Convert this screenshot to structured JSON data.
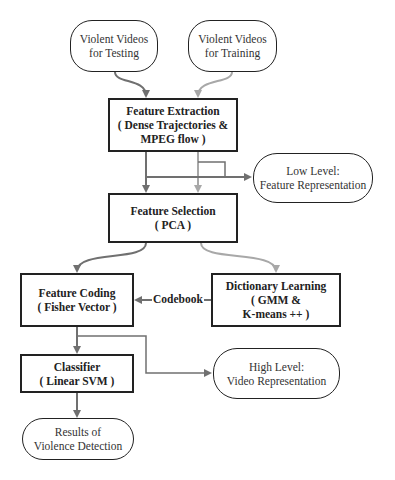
{
  "nodes": {
    "testing": {
      "line1": "Violent Videos",
      "line2": "for Testing"
    },
    "training": {
      "line1": "Violent Videos",
      "line2": "for Training"
    },
    "extraction": {
      "line1": "Feature Extraction",
      "line2": "( Dense Trajectories &",
      "line3": "MPEG flow )"
    },
    "low_level": {
      "line1": "Low Level:",
      "line2": "Feature Representation"
    },
    "selection": {
      "line1": "Feature Selection",
      "line2": "( PCA )"
    },
    "coding": {
      "line1": "Feature Coding",
      "line2": "( Fisher Vector )"
    },
    "dictionary": {
      "line1": "Dictionary Learning",
      "line2": "( GMM &",
      "line3": "K-means ++ )"
    },
    "classifier": {
      "line1": "Classifier",
      "line2": "( Linear SVM )"
    },
    "high_level": {
      "line1": "High Level:",
      "line2": "Video Representation"
    },
    "results": {
      "line1": "Results of",
      "line2": "Violence Detection"
    }
  },
  "edges": {
    "codebook_label": "Codebook"
  },
  "colors": {
    "test_path": "#707070",
    "train_path": "#a8a8a8",
    "border": "#222222"
  }
}
